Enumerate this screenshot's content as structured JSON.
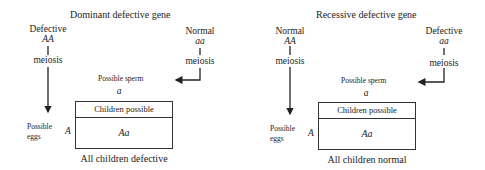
{
  "panels": [
    {
      "title": "Dominant defective gene",
      "left_parent": {
        "label": "Defective",
        "genotype": "AA",
        "process": "meiosis"
      },
      "right_parent": {
        "label": "Normal",
        "genotype": "aa",
        "process": "meiosis"
      },
      "sperm_label": "Possible sperm",
      "sperm_allele": "a",
      "eggs_label_line1": "Possible",
      "eggs_label_line2": "eggs",
      "egg_allele": "A",
      "table_header": "Children possible",
      "child_genotype": "Aa",
      "conclusion": "All children defective"
    },
    {
      "title": "Recessive defective gene",
      "left_parent": {
        "label": "Normal",
        "genotype": "AA",
        "process": "meiosis"
      },
      "right_parent": {
        "label": "Defective",
        "genotype": "aa",
        "process": "meiosis"
      },
      "sperm_label": "Possible sperm",
      "sperm_allele": "a",
      "eggs_label_line1": "Possible",
      "eggs_label_line2": "eggs",
      "egg_allele": "A",
      "table_header": "Children possible",
      "child_genotype": "Aa",
      "conclusion": "All children normal"
    }
  ],
  "colors": {
    "ink": "#222222",
    "background": "#ffffff"
  }
}
